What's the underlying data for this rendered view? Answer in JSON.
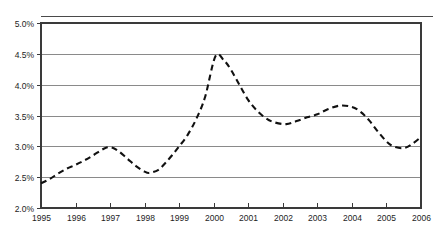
{
  "chart_data": {
    "type": "line",
    "title": "",
    "subtitle": "",
    "xlabel": "",
    "ylabel": "",
    "ylim": [
      2.0,
      5.0
    ],
    "xlim": [
      1995,
      2006
    ],
    "y_tick_step": 0.5,
    "grid": true,
    "legend": false,
    "legend_position": "none",
    "line_style": "dashed",
    "line_color": "#111111",
    "grid_color": "#8a8a8a",
    "axis_color": "#3a3a3a",
    "y_ticks": [
      "2.0%",
      "2.5%",
      "3.0%",
      "3.5%",
      "4.0%",
      "4.5%",
      "5.0%"
    ],
    "y_tick_values": [
      2.0,
      2.5,
      3.0,
      3.5,
      4.0,
      4.5,
      5.0
    ],
    "x_ticks": [
      "1995",
      "1996",
      "1997",
      "1998",
      "1999",
      "2000",
      "2001",
      "2002",
      "2003",
      "2004",
      "2005",
      "2006"
    ],
    "x_tick_values": [
      1995,
      1996,
      1997,
      1998,
      1999,
      2000,
      2001,
      2002,
      2003,
      2004,
      2005,
      2006
    ],
    "series": [
      {
        "name": "rate",
        "x": [
          1995.0,
          1995.25,
          1995.5,
          1995.75,
          1996.0,
          1996.25,
          1996.5,
          1996.75,
          1996.9,
          1997.05,
          1997.25,
          1997.5,
          1997.75,
          1998.0,
          1998.15,
          1998.4,
          1998.6,
          1998.8,
          1999.0,
          1999.25,
          1999.5,
          1999.75,
          2000.05,
          2000.3,
          2000.5,
          2000.75,
          2001.0,
          2001.25,
          2001.5,
          2001.75,
          2002.1,
          2002.4,
          2002.7,
          2003.0,
          2003.3,
          2003.65,
          2004.0,
          2004.25,
          2004.5,
          2004.75,
          2005.0,
          2005.2,
          2005.5,
          2005.75,
          2006.0
        ],
        "y": [
          2.4,
          2.47,
          2.56,
          2.64,
          2.7,
          2.77,
          2.85,
          2.94,
          2.98,
          2.98,
          2.92,
          2.8,
          2.68,
          2.59,
          2.57,
          2.62,
          2.73,
          2.86,
          3.0,
          3.19,
          3.45,
          3.8,
          4.46,
          4.39,
          4.24,
          3.99,
          3.75,
          3.58,
          3.46,
          3.39,
          3.36,
          3.41,
          3.47,
          3.52,
          3.6,
          3.66,
          3.64,
          3.56,
          3.42,
          3.24,
          3.08,
          3.0,
          2.97,
          3.04,
          3.15
        ]
      }
    ],
    "annotations": []
  },
  "figure": {
    "top_rule_present": true,
    "background_color": "#ffffff"
  }
}
